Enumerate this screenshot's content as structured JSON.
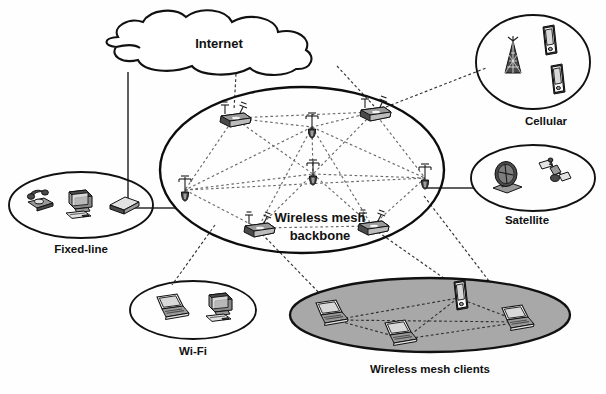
{
  "diagram": {
    "background_color": "#ffffff",
    "line_color": "#111111",
    "shaded_fill": "#a8a8a8"
  },
  "internet": {
    "label": "Internet",
    "shape": "cloud"
  },
  "backbone": {
    "label_line1": "Wireless mesh",
    "label_line2": "backbone",
    "shape": "ellipse",
    "node_count": 8,
    "gateway_count": 4,
    "router_count": 4
  },
  "clusters": [
    {
      "id": "fixed-line",
      "label": "Fixed-line",
      "shape": "ellipse",
      "filled": false,
      "devices": [
        "telephone-icon",
        "desktop-computer-icon",
        "modem-icon"
      ]
    },
    {
      "id": "wifi",
      "label": "Wi-Fi",
      "shape": "ellipse",
      "filled": false,
      "devices": [
        "laptop-icon",
        "desktop-computer-icon"
      ]
    },
    {
      "id": "cellular",
      "label": "Cellular",
      "shape": "ellipse",
      "filled": false,
      "devices": [
        "cell-tower-icon",
        "mobile-phone-icon",
        "mobile-phone-icon"
      ]
    },
    {
      "id": "satellite",
      "label": "Satellite",
      "shape": "ellipse",
      "filled": false,
      "devices": [
        "satellite-dish-icon",
        "satellite-icon"
      ]
    },
    {
      "id": "wireless-mesh-clients",
      "label": "Wireless mesh clients",
      "shape": "ellipse",
      "filled": true,
      "fill_color": "#a8a8a8",
      "devices": [
        "laptop-icon",
        "laptop-icon",
        "laptop-icon",
        "mobile-phone-icon"
      ]
    }
  ],
  "links": [
    {
      "from": "internet",
      "to": "fixed-line",
      "style": "solid"
    },
    {
      "from": "internet",
      "to": "backbone-gateway-top-left",
      "style": "dashed"
    },
    {
      "from": "internet",
      "to": "backbone-gateway-top-right",
      "style": "dashed"
    },
    {
      "from": "backbone-gateway-top-right",
      "to": "cellular",
      "style": "dashed"
    },
    {
      "from": "backbone-node-right",
      "to": "satellite",
      "style": "solid"
    },
    {
      "from": "backbone-node-left",
      "to": "wifi",
      "style": "dashed"
    },
    {
      "from": "backbone-router-bottom-left",
      "to": "wireless-mesh-clients",
      "style": "dashed"
    },
    {
      "from": "backbone-router-bottom-right",
      "to": "wireless-mesh-clients",
      "style": "dashed"
    },
    {
      "from": "backbone-node-right",
      "to": "wireless-mesh-clients",
      "style": "dashed"
    }
  ]
}
